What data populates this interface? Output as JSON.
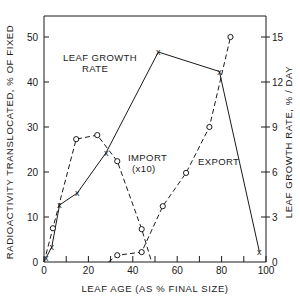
{
  "chart_data": {
    "type": "line",
    "title": "",
    "xlabel": "LEAF AGE (AS % FINAL SIZE)",
    "ylabel_left": "RADIOACTIVITY TRANSLOCATED, % OF FIXED",
    "ylabel_right": "LEAF GROWTH RATE, % / DAY",
    "xlim": [
      0,
      100
    ],
    "ylim_left": [
      0,
      55
    ],
    "ylim_right": [
      0,
      16.5
    ],
    "x_ticks": [
      0,
      20,
      40,
      60,
      80,
      100
    ],
    "x_minor_ticks": [
      10,
      30,
      50,
      70,
      90
    ],
    "y_left_ticks": [
      0,
      10,
      20,
      30,
      40,
      50
    ],
    "y_right_ticks": [
      0,
      3,
      6,
      9,
      12,
      15
    ],
    "grid": false,
    "legend": "none (inline annotations)",
    "annotations": [
      {
        "text": "LEAF GROWTH RATE",
        "lines": [
          "LEAF GROWTH",
          "RATE"
        ]
      },
      {
        "text": "IMPORT (x10)",
        "lines": [
          "IMPORT",
          "(x10)"
        ]
      },
      {
        "text": "EXPORT",
        "lines": [
          "EXPORT"
        ]
      }
    ],
    "series": [
      {
        "name": "Leaf growth rate",
        "axis": "right",
        "style": "solid",
        "marker": "x",
        "x": [
          1,
          3.5,
          7,
          15,
          28,
          51.5,
          79,
          97
        ],
        "values": [
          0.3,
          1.0,
          3.8,
          4.6,
          7.3,
          14.0,
          12.7,
          0.7
        ]
      },
      {
        "name": "Import (x10)",
        "axis": "left",
        "style": "dashed",
        "marker": "o",
        "x": [
          0,
          4,
          14.5,
          24,
          33,
          44,
          48.5
        ],
        "values": [
          0,
          7.5,
          27.3,
          28.2,
          22.4,
          7.3,
          0
        ],
        "marker_mask": [
          false,
          true,
          true,
          true,
          true,
          true,
          false
        ]
      },
      {
        "name": "Export",
        "axis": "left",
        "style": "dashed",
        "marker": "o",
        "x": [
          29,
          33,
          44,
          53.5,
          64,
          74.5,
          84
        ],
        "values": [
          0,
          1.5,
          2.2,
          12.4,
          19.8,
          30,
          50
        ],
        "marker_mask": [
          false,
          true,
          true,
          true,
          true,
          true,
          true
        ]
      }
    ]
  },
  "labels": {
    "xlabel": "LEAF AGE (AS % FINAL SIZE)",
    "ylabel_left": "RADIOACTIVITY TRANSLOCATED, % OF FIXED",
    "ylabel_right": "LEAF GROWTH RATE, % / DAY",
    "growth_line1": "LEAF GROWTH",
    "growth_line2": "RATE",
    "import_line1": "IMPORT",
    "import_line2": "(x10)",
    "export": "EXPORT"
  }
}
